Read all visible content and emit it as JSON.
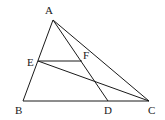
{
  "diagram": {
    "points": {
      "A": {
        "label": "A",
        "x": 53,
        "y": 20,
        "lx": 45,
        "ly": 14
      },
      "B": {
        "label": "B",
        "x": 23,
        "y": 101,
        "lx": 15,
        "ly": 114
      },
      "C": {
        "label": "C",
        "x": 149,
        "y": 101,
        "lx": 148,
        "ly": 114
      },
      "D": {
        "label": "D",
        "x": 108,
        "y": 101,
        "lx": 104,
        "ly": 114
      },
      "E": {
        "label": "E",
        "x": 38,
        "y": 61,
        "lx": 27,
        "ly": 66
      },
      "F": {
        "label": "F",
        "x": 82,
        "y": 61,
        "lx": 83,
        "ly": 59
      }
    },
    "segments": [
      [
        "A",
        "B"
      ],
      [
        "A",
        "C"
      ],
      [
        "B",
        "C"
      ],
      [
        "A",
        "D"
      ],
      [
        "E",
        "F"
      ],
      [
        "E",
        "C"
      ]
    ],
    "stroke_color": "#1a1a1a"
  }
}
